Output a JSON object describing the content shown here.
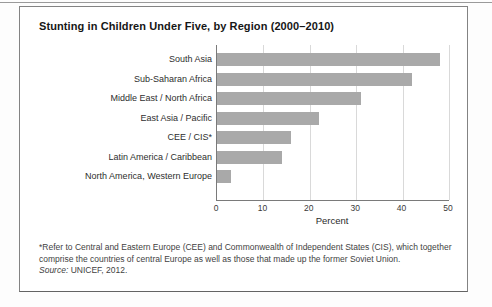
{
  "figure": {
    "title": "Stunting in Children Under Five, by Region (2000–2010)",
    "footnote": "*Refer to Central and Eastern Europe (CEE) and Commonwealth of Independent States (CIS), which together comprise the countries of central Europe as well as those that made up the former Soviet Union.",
    "source_label": "Source:",
    "source_text": " UNICEF, 2012."
  },
  "chart_data": {
    "type": "bar",
    "orientation": "horizontal",
    "title": "Stunting in Children Under Five, by Region (2000–2010)",
    "categories": [
      "South Asia",
      "Sub-Saharan Africa",
      "Middle East / North Africa",
      "East Asia / Pacific",
      "CEE / CIS*",
      "Latin America / Caribbean",
      "North America, Western Europe"
    ],
    "values": [
      48,
      42,
      31,
      22,
      16,
      14,
      3
    ],
    "xlabel": "Percent",
    "xlim": [
      0,
      50
    ],
    "xticks": [
      0,
      10,
      20,
      30,
      40,
      50
    ],
    "grid": true,
    "legend": "none",
    "bar_color": "#a9a9a9",
    "gridline_color": "#d9d9d9",
    "axis_color": "#7a7a7a"
  }
}
